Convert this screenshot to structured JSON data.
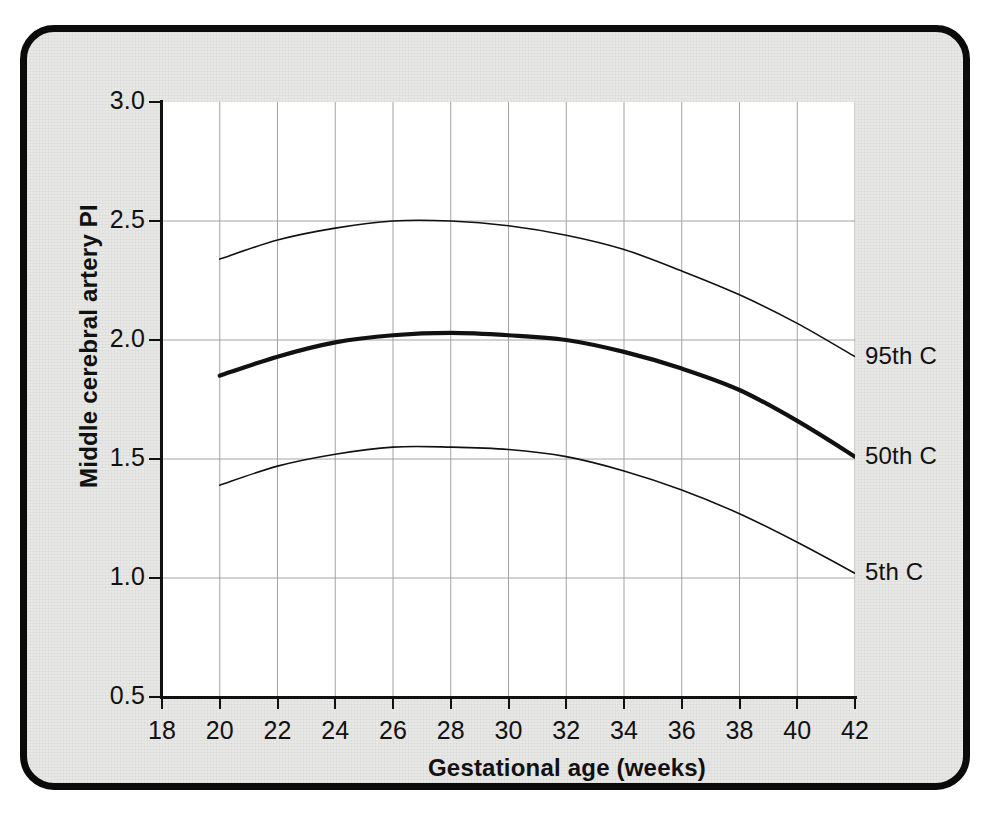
{
  "figure": {
    "background_color": "#e8e8e6",
    "frame_color": "#0b0b0b",
    "plot_background": "#ffffff"
  },
  "chart_data": {
    "type": "line",
    "title": "",
    "xlabel": "Gestational age (weeks)",
    "ylabel": "Middle cerebral artery PI",
    "xlim": [
      18,
      42
    ],
    "ylim": [
      0.5,
      3.0
    ],
    "xticks": [
      18,
      20,
      22,
      24,
      26,
      28,
      30,
      32,
      34,
      36,
      38,
      40,
      42
    ],
    "yticks": [
      0.5,
      1.0,
      1.5,
      2.0,
      2.5,
      3.0
    ],
    "xtick_labels": [
      "18",
      "20",
      "22",
      "24",
      "26",
      "28",
      "30",
      "32",
      "34",
      "36",
      "38",
      "40",
      "42"
    ],
    "ytick_labels": [
      "0.5",
      "1.0",
      "1.5",
      "2.0",
      "2.5",
      "3.0"
    ],
    "grid": {
      "vertical_at": [
        20,
        22,
        24,
        26,
        28,
        30,
        32,
        34,
        36,
        38,
        40,
        42
      ],
      "horizontal_at": [
        1.0,
        1.5,
        2.0,
        2.5
      ],
      "color": "#9a9a9a"
    },
    "legend_position": "right-inline",
    "x": [
      20,
      22,
      24,
      26,
      28,
      30,
      32,
      34,
      36,
      38,
      40,
      42
    ],
    "series": [
      {
        "name": "95th C",
        "label": "95th C",
        "line_width": 1.6,
        "color": "#111111",
        "values": [
          2.34,
          2.42,
          2.47,
          2.5,
          2.5,
          2.48,
          2.44,
          2.38,
          2.29,
          2.19,
          2.07,
          1.93
        ]
      },
      {
        "name": "50th C",
        "label": "50th C",
        "line_width": 4.2,
        "color": "#111111",
        "values": [
          1.85,
          1.93,
          1.99,
          2.02,
          2.03,
          2.02,
          2.0,
          1.95,
          1.88,
          1.79,
          1.66,
          1.51
        ]
      },
      {
        "name": "5th C",
        "label": "5th C",
        "line_width": 1.6,
        "color": "#111111",
        "values": [
          1.39,
          1.47,
          1.52,
          1.55,
          1.55,
          1.54,
          1.51,
          1.45,
          1.37,
          1.27,
          1.15,
          1.02
        ]
      }
    ]
  }
}
